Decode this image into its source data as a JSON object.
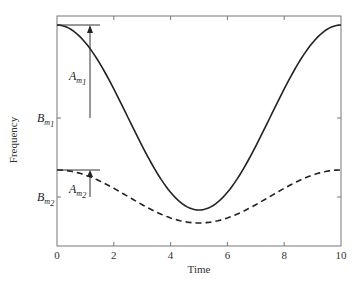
{
  "chart_data": {
    "type": "line",
    "title": "",
    "xlabel": "Time",
    "ylabel": "Frequency",
    "xlim": [
      0,
      10
    ],
    "xticks": [
      0,
      2,
      4,
      6,
      8,
      10
    ],
    "xtick_labels": [
      "0",
      "2",
      "4",
      "6",
      "8",
      "10"
    ],
    "yticks_labels": [
      "B_m1",
      "B_m2"
    ],
    "grid": false,
    "legend": null,
    "series": [
      {
        "name": "f1 (solid)",
        "style": "solid",
        "formula": "B_m1 + A_m1*cos(2*pi*t/10)",
        "x": [
          0,
          1,
          2,
          3,
          4,
          5,
          6,
          7,
          8,
          9,
          10
        ],
        "values_relative": [
          1.0,
          0.809,
          0.309,
          -0.309,
          -0.809,
          -1.0,
          -0.809,
          -0.309,
          0.309,
          0.809,
          1.0
        ]
      },
      {
        "name": "f2 (dashed)",
        "style": "dashed",
        "formula": "B_m2 + A_m2*cos(2*pi*t/10)",
        "x": [
          0,
          1,
          2,
          3,
          4,
          5,
          6,
          7,
          8,
          9,
          10
        ],
        "values_relative": [
          1.0,
          0.809,
          0.309,
          -0.309,
          -0.809,
          -1.0,
          -0.809,
          -0.309,
          0.309,
          0.809,
          1.0
        ]
      }
    ],
    "annotations": [
      {
        "text": "A_m1",
        "main": "A",
        "sub": "m",
        "subsub": "1",
        "meaning": "amplitude of solid curve (arrow from B_m1 to peak)"
      },
      {
        "text": "A_m2",
        "main": "A",
        "sub": "m",
        "subsub": "2",
        "meaning": "amplitude of dashed curve (arrow from B_m2 to peak)"
      },
      {
        "text": "B_m1",
        "main": "B",
        "sub": "m",
        "subsub": "1",
        "meaning": "mean level of solid curve"
      },
      {
        "text": "B_m2",
        "main": "B",
        "sub": "m",
        "subsub": "2",
        "meaning": "mean level of dashed curve"
      }
    ]
  },
  "labels": {
    "xlabel": "Time",
    "ylabel": "Frequency",
    "xticks": [
      "0",
      "2",
      "4",
      "6",
      "8",
      "10"
    ],
    "am1_main": "A",
    "am1_sub": "m",
    "am1_subsub": "1",
    "am2_main": "A",
    "am2_sub": "m",
    "am2_subsub": "2",
    "bm1_main": "B",
    "bm1_sub": "m",
    "bm1_subsub": "1",
    "bm2_main": "B",
    "bm2_sub": "m",
    "bm2_subsub": "2"
  }
}
